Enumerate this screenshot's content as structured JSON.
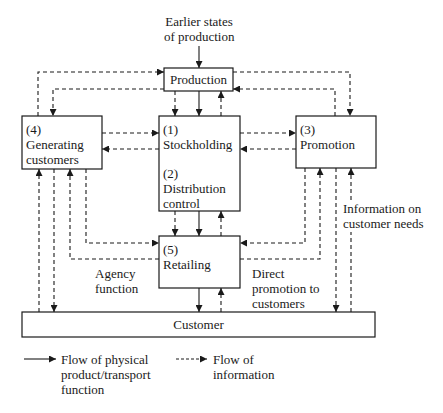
{
  "diagram": {
    "top_input": {
      "line1": "Earlier states",
      "line2": "of production"
    },
    "nodes": {
      "production": {
        "label": "Production"
      },
      "generating": {
        "num": "(4)",
        "line1": "Generating",
        "line2": "customers"
      },
      "stockholding": {
        "num": "(1)",
        "line1": "Stockholding"
      },
      "distribution": {
        "num": "(2)",
        "line1": "Distribution",
        "line2": "control"
      },
      "promotion": {
        "num": "(3)",
        "line1": "Promotion"
      },
      "retailing": {
        "num": "(5)",
        "line1": "Retailing"
      },
      "customer": {
        "label": "Customer"
      }
    },
    "annotations": {
      "agency": {
        "line1": "Agency",
        "line2": "function"
      },
      "direct": {
        "line1": "Direct",
        "line2": "promotion to",
        "line3": "customers"
      },
      "info_needs": {
        "line1": "Information on",
        "line2": "customer needs"
      }
    },
    "legend": {
      "physical": {
        "line1": "Flow of physical",
        "line2": "product/transport",
        "line3": "function",
        "style": "solid"
      },
      "information": {
        "line1": "Flow of",
        "line2": "information",
        "style": "dashed"
      }
    },
    "colors": {
      "line": "#1a1a1a",
      "background": "#ffffff"
    }
  }
}
